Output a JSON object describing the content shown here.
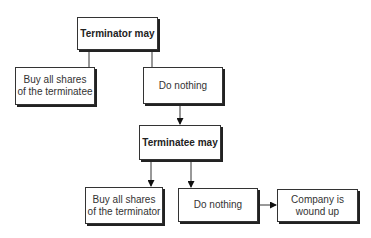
{
  "diagram": {
    "type": "flowchart",
    "clipped_header_text": "...",
    "nodes": {
      "terminator": {
        "label": "Terminator may"
      },
      "buy_terminatee": {
        "label": "Buy all shares\nof the terminatee"
      },
      "do_nothing_1": {
        "label": "Do nothing"
      },
      "terminatee": {
        "label": "Terminatee may"
      },
      "buy_terminator": {
        "label": "Buy all shares\nof the terminator"
      },
      "do_nothing_2": {
        "label": "Do nothing"
      },
      "wound_up": {
        "label": "Company is\nwound up"
      }
    },
    "edges": [
      {
        "from": "terminator",
        "to": "buy_terminatee",
        "arrow": false
      },
      {
        "from": "terminator",
        "to": "do_nothing_1",
        "arrow": false
      },
      {
        "from": "do_nothing_1",
        "to": "terminatee",
        "arrow": true
      },
      {
        "from": "terminatee",
        "to": "buy_terminator",
        "arrow": true
      },
      {
        "from": "terminatee",
        "to": "do_nothing_2",
        "arrow": true
      },
      {
        "from": "do_nothing_2",
        "to": "wound_up",
        "arrow": true
      }
    ]
  }
}
